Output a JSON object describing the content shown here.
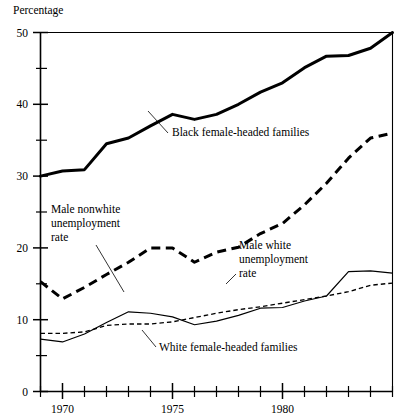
{
  "chart_data": {
    "type": "line",
    "title": "",
    "ylabel": "Percentage",
    "xlabel": "",
    "ylim": [
      0,
      50
    ],
    "xlim": [
      1969,
      1985
    ],
    "grid": false,
    "legend_position": "inline-annotations",
    "y_major_ticks": [
      0,
      10,
      20,
      30,
      40,
      50
    ],
    "y_major_tick_labels": [
      "0",
      "10",
      "20",
      "30",
      "40",
      "50"
    ],
    "y_minor_ticks": [
      5,
      15,
      25,
      35,
      45
    ],
    "x_major_ticks": [
      1970,
      1975,
      1980
    ],
    "x_major_tick_labels": [
      "1970",
      "1975",
      "1980"
    ],
    "x_minor_ticks": [
      1969,
      1971,
      1972,
      1973,
      1974,
      1976,
      1977,
      1978,
      1979,
      1981,
      1982,
      1983,
      1984,
      1985
    ],
    "x": [
      1969,
      1970,
      1971,
      1972,
      1973,
      1974,
      1975,
      1976,
      1977,
      1978,
      1979,
      1980,
      1981,
      1982,
      1983,
      1984,
      1985
    ],
    "series": [
      {
        "name": "Black female-headed families",
        "style": "thick-solid",
        "color": "#000000",
        "values": [
          30.0,
          30.7,
          30.9,
          34.5,
          35.3,
          37.0,
          38.6,
          37.9,
          38.6,
          40.0,
          41.7,
          43.0,
          45.1,
          46.7,
          46.8,
          47.8,
          50.0
        ]
      },
      {
        "name": "Male nonwhite unemployment rate",
        "style": "thick-dashed",
        "color": "#000000",
        "values": [
          15.3,
          12.9,
          14.5,
          16.3,
          18.0,
          20.0,
          20.0,
          18.0,
          19.4,
          20.1,
          22.0,
          23.4,
          26.0,
          29.0,
          32.5,
          35.3,
          36.0
        ]
      },
      {
        "name": "Male white unemployment rate",
        "style": "thin-dashed",
        "color": "#000000",
        "values": [
          8.1,
          8.1,
          8.3,
          9.2,
          9.4,
          9.4,
          9.7,
          10.3,
          10.9,
          11.4,
          11.8,
          12.3,
          12.8,
          13.3,
          13.9,
          14.8,
          15.1
        ]
      },
      {
        "name": "White female-headed families",
        "style": "thin-solid",
        "color": "#000000",
        "values": [
          7.3,
          6.9,
          8.0,
          9.6,
          11.1,
          10.9,
          10.4,
          9.3,
          9.8,
          10.6,
          11.6,
          11.7,
          12.6,
          13.3,
          16.7,
          16.8,
          16.5
        ]
      }
    ],
    "annotations": [
      {
        "text": "Black female-headed families",
        "x_px": 172,
        "y_px": 136
      },
      {
        "text": "Male nonwhite",
        "x_px": 51,
        "y_px": 213
      },
      {
        "text": "unemployment",
        "x_px": 51,
        "y_px": 227
      },
      {
        "text": "rate",
        "x_px": 51,
        "y_px": 241
      },
      {
        "text": "Male white",
        "x_px": 239,
        "y_px": 249
      },
      {
        "text": "unemployment",
        "x_px": 239,
        "y_px": 263
      },
      {
        "text": "rate",
        "x_px": 239,
        "y_px": 277
      },
      {
        "text": "White female-headed families",
        "x_px": 159,
        "y_px": 351
      }
    ]
  }
}
